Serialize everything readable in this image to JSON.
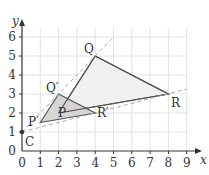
{
  "diagram": {
    "type": "enlargement on coordinate grid",
    "x_axis": {
      "label": "x",
      "ticks": [
        "0",
        "1",
        "2",
        "3",
        "4",
        "5",
        "6",
        "7",
        "8",
        "9"
      ]
    },
    "y_axis": {
      "label": "y",
      "ticks": [
        "0",
        "1",
        "2",
        "3",
        "4",
        "5",
        "6"
      ]
    },
    "centre": {
      "label": "C",
      "x": 0,
      "y": 1
    },
    "original_triangle": {
      "vertices": [
        {
          "label": "P",
          "x": 2,
          "y": 2
        },
        {
          "label": "Q",
          "x": 4,
          "y": 5
        },
        {
          "label": "R",
          "x": 8,
          "y": 3
        }
      ]
    },
    "image_triangle": {
      "vertices": [
        {
          "label": "P′",
          "x": 1,
          "y": 1.5
        },
        {
          "label": "Q′",
          "x": 2,
          "y": 3
        },
        {
          "label": "R′",
          "x": 4,
          "y": 2
        }
      ]
    },
    "colors": {
      "grid": "#e2e2e2",
      "axes": "#333333",
      "triangle_edge": "#555555",
      "image_fill": "#cfcfcf",
      "original_fill": "#f0f0f0",
      "construction_line": "#aaaaaa"
    }
  }
}
